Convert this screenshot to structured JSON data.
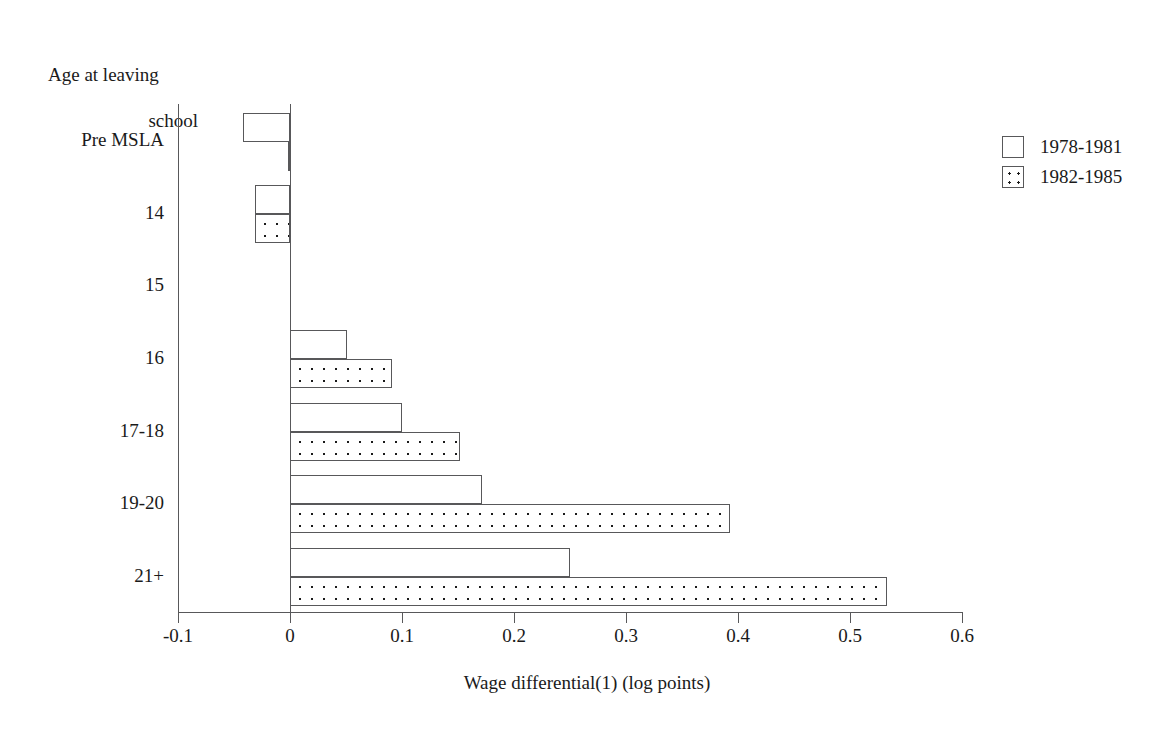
{
  "chart_data": {
    "type": "bar",
    "orientation": "horizontal",
    "title": "",
    "xlabel": "Wage differential(1) (log points)",
    "ylabel": "Age at leaving\nschool",
    "ylabel_line1": "Age at leaving",
    "ylabel_line2": "school",
    "categories": [
      "Pre MSLA",
      "14",
      "15",
      "16",
      "17-18",
      "19-20",
      "21+"
    ],
    "series": [
      {
        "name": "1978-1981",
        "fill": "open",
        "values": [
          -0.042,
          -0.031,
          0.0,
          0.051,
          0.1,
          0.171,
          0.25
        ]
      },
      {
        "name": "1982-1985",
        "fill": "dotted",
        "values": [
          -0.002,
          -0.031,
          0.0,
          0.091,
          0.152,
          0.393,
          0.533
        ]
      }
    ],
    "xlim": [
      -0.1,
      0.6
    ],
    "xticks": [
      -0.1,
      0,
      0.1,
      0.2,
      0.3,
      0.4,
      0.5,
      0.6
    ],
    "xtick_labels": [
      "-0.1",
      "0",
      "0.1",
      "0.2",
      "0.3",
      "0.4",
      "0.5",
      "0.6"
    ],
    "grid": false,
    "legend_position": "right",
    "zero_reference_line": true,
    "colors": {
      "line": "#58585a",
      "text": "#1a1a1a",
      "background": "#ffffff",
      "dot": "#1a1a1a"
    }
  }
}
